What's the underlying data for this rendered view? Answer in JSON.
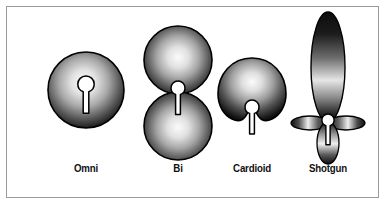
{
  "figure": {
    "background_color": "#ffffff",
    "frame_color": "#9a9a9a",
    "label_color": "#111111",
    "shape_outline_color": "#000000",
    "shape_dark_color": "#1a1a1a",
    "shape_light_color": "#f2f2f2",
    "mic_fill_color": "#ffffff"
  },
  "patterns": [
    {
      "id": "omni",
      "label": "Omni",
      "shape": "circle",
      "description": "Single circular pickup lobe centered on the microphone capsule",
      "mic_icon": "microphone-capsule-icon"
    },
    {
      "id": "bi",
      "label": "Bi",
      "shape": "figure-eight",
      "description": "Two equal lobes front and rear meeting at the capsule",
      "mic_icon": "microphone-capsule-icon"
    },
    {
      "id": "cardioid",
      "label": "Cardioid",
      "shape": "heart-dome",
      "description": "Forward dome lobe with rear null notch at the capsule",
      "mic_icon": "microphone-capsule-icon"
    },
    {
      "id": "shotgun",
      "label": "Shotgun",
      "shape": "lobar",
      "description": "Narrow long forward lobe with two side lobes and a small rear lobe",
      "mic_icon": "microphone-capsule-icon"
    }
  ]
}
